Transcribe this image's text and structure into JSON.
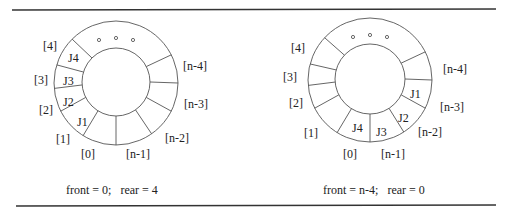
{
  "figure": {
    "rules": {
      "top_y": 10,
      "bottom_y": 206,
      "x1": 12,
      "x2": 496
    },
    "queues": [
      {
        "id": "left",
        "center": [
          116,
          83
        ],
        "outer_r": 62,
        "inner_r": 34,
        "dividers_deg": [
          -90,
          -122,
          -153,
          -175,
          163,
          135,
          27,
          0,
          -27,
          -55
        ],
        "ellipsis": "o o o",
        "index_labels": [
          {
            "text": "[0]",
            "x": 81,
            "y": 158
          },
          {
            "text": "[1]",
            "x": 56,
            "y": 143
          },
          {
            "text": "[2]",
            "x": 39,
            "y": 114
          },
          {
            "text": "[3]",
            "x": 34,
            "y": 84
          },
          {
            "text": "[4]",
            "x": 43,
            "y": 50
          },
          {
            "text": "[n-4]",
            "x": 183,
            "y": 70
          },
          {
            "text": "[n-3]",
            "x": 184,
            "y": 108
          },
          {
            "text": "[n-2]",
            "x": 165,
            "y": 142
          },
          {
            "text": "[n-1]",
            "x": 126,
            "y": 158
          }
        ],
        "cells": [
          {
            "text": "J4",
            "x": 68,
            "y": 62
          },
          {
            "text": "J3",
            "x": 63,
            "y": 85
          },
          {
            "text": "J2",
            "x": 63,
            "y": 106
          },
          {
            "text": "J1",
            "x": 77,
            "y": 126
          }
        ],
        "caption": {
          "text": "front = 0;   rear = 4",
          "x": 66,
          "y": 194
        }
      },
      {
        "id": "right",
        "center": [
          370,
          80
        ],
        "outer_r": 62,
        "inner_r": 35,
        "dividers_deg": [
          -90,
          -122,
          -153,
          -175,
          165,
          137,
          27,
          0,
          -27,
          -57
        ],
        "ellipsis": "o o o",
        "index_labels": [
          {
            "text": "[4]",
            "x": 291,
            "y": 52
          },
          {
            "text": "[3]",
            "x": 283,
            "y": 81
          },
          {
            "text": "[2]",
            "x": 289,
            "y": 107
          },
          {
            "text": "[1]",
            "x": 304,
            "y": 137
          },
          {
            "text": "[0]",
            "x": 343,
            "y": 158
          },
          {
            "text": "[n-1]",
            "x": 381,
            "y": 158
          },
          {
            "text": "[n-2]",
            "x": 418,
            "y": 136
          },
          {
            "text": "[n-3]",
            "x": 440,
            "y": 111
          },
          {
            "text": "[n-4]",
            "x": 443,
            "y": 73
          }
        ],
        "cells": [
          {
            "text": "J1",
            "x": 410,
            "y": 98
          },
          {
            "text": "J2",
            "x": 398,
            "y": 122
          },
          {
            "text": "J3",
            "x": 376,
            "y": 136
          },
          {
            "text": "J4",
            "x": 352,
            "y": 132
          }
        ],
        "caption": {
          "text": "front = n-4;   rear = 0",
          "x": 323,
          "y": 194
        }
      }
    ]
  }
}
